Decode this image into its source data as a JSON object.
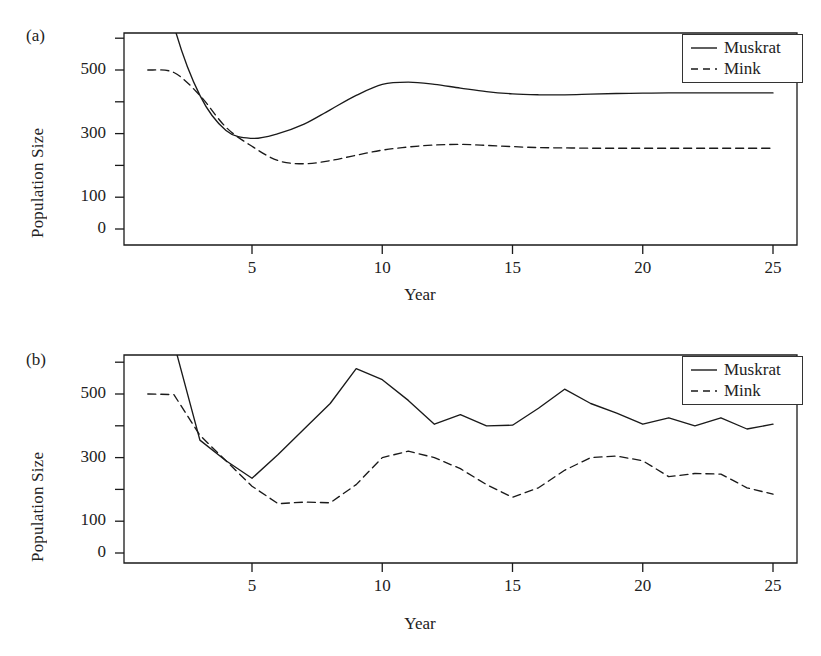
{
  "figure": {
    "panels": [
      {
        "id": "a",
        "label": "(a)",
        "ylabel": "Population Size",
        "xlabel": "Year",
        "legend": [
          {
            "name": "Muskrat",
            "style": "solid"
          },
          {
            "name": "Mink",
            "style": "dashed"
          }
        ],
        "yticks": [
          {
            "value": 600,
            "label": ""
          },
          {
            "value": 500,
            "label": "500"
          },
          {
            "value": 400,
            "label": ""
          },
          {
            "value": 300,
            "label": "300"
          },
          {
            "value": 200,
            "label": ""
          },
          {
            "value": 100,
            "label": "100"
          },
          {
            "value": 0,
            "label": "0"
          }
        ],
        "xticks": [
          {
            "value": 5,
            "label": "5"
          },
          {
            "value": 10,
            "label": "10"
          },
          {
            "value": 15,
            "label": "15"
          },
          {
            "value": 20,
            "label": "20"
          },
          {
            "value": 25,
            "label": "25"
          }
        ]
      },
      {
        "id": "b",
        "label": "(b)",
        "ylabel": "Population Size",
        "xlabel": "Year",
        "legend": [
          {
            "name": "Muskrat",
            "style": "solid"
          },
          {
            "name": "Mink",
            "style": "dashed"
          }
        ],
        "yticks": [
          {
            "value": 600,
            "label": ""
          },
          {
            "value": 500,
            "label": "500"
          },
          {
            "value": 400,
            "label": ""
          },
          {
            "value": 300,
            "label": "300"
          },
          {
            "value": 200,
            "label": ""
          },
          {
            "value": 100,
            "label": "100"
          },
          {
            "value": 0,
            "label": "0"
          }
        ],
        "xticks": [
          {
            "value": 5,
            "label": "5"
          },
          {
            "value": 10,
            "label": "10"
          },
          {
            "value": 15,
            "label": "15"
          },
          {
            "value": 20,
            "label": "20"
          },
          {
            "value": 25,
            "label": "25"
          }
        ]
      }
    ],
    "colors": {
      "ink": "#1a1a1a",
      "background": "#ffffff"
    }
  },
  "chart_data": [
    {
      "type": "line",
      "panel": "(a)",
      "title": "",
      "xlabel": "Year",
      "ylabel": "Population Size",
      "xlim": [
        1,
        25
      ],
      "ylim": [
        0,
        640
      ],
      "grid": false,
      "legend_position": "top-right",
      "x": [
        1,
        2,
        3,
        4,
        5,
        6,
        7,
        8,
        9,
        10,
        11,
        12,
        13,
        14,
        15,
        16,
        17,
        18,
        19,
        20,
        21,
        22,
        23,
        24,
        25
      ],
      "series": [
        {
          "name": "Muskrat",
          "style": "solid",
          "values": [
            1000,
            640,
            420,
            310,
            285,
            300,
            330,
            375,
            420,
            455,
            462,
            455,
            443,
            432,
            425,
            422,
            422,
            424,
            426,
            427,
            428,
            428,
            428,
            428,
            428
          ]
        },
        {
          "name": "Mink",
          "style": "dashed",
          "values": [
            500,
            492,
            420,
            320,
            260,
            215,
            205,
            215,
            232,
            248,
            258,
            264,
            266,
            263,
            259,
            256,
            255,
            254,
            254,
            254,
            254,
            254,
            254,
            254,
            254
          ]
        }
      ]
    },
    {
      "type": "line",
      "panel": "(b)",
      "title": "",
      "xlabel": "Year",
      "ylabel": "Population Size",
      "xlim": [
        1,
        25
      ],
      "ylim": [
        0,
        640
      ],
      "grid": false,
      "legend_position": "top-right",
      "x": [
        1,
        2,
        3,
        4,
        5,
        6,
        7,
        8,
        9,
        10,
        11,
        12,
        13,
        14,
        15,
        16,
        17,
        18,
        19,
        20,
        21,
        22,
        23,
        24,
        25
      ],
      "series": [
        {
          "name": "Muskrat",
          "style": "solid",
          "values": [
            1000,
            660,
            355,
            290,
            235,
            310,
            390,
            470,
            580,
            545,
            480,
            405,
            435,
            400,
            402,
            455,
            515,
            470,
            440,
            405,
            425,
            400,
            425,
            390,
            405
          ]
        },
        {
          "name": "Mink",
          "style": "dashed",
          "values": [
            500,
            498,
            370,
            290,
            210,
            155,
            160,
            158,
            215,
            300,
            320,
            300,
            265,
            215,
            175,
            205,
            260,
            300,
            305,
            290,
            240,
            250,
            248,
            205,
            185
          ]
        }
      ]
    }
  ]
}
